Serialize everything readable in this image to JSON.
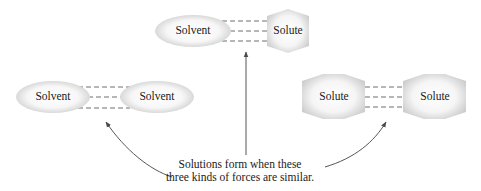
{
  "diagram": {
    "type": "intermolecular-forces-in-solutions",
    "pairs": [
      {
        "id": "solvent-solute",
        "position": "top-center",
        "left": {
          "label": "Solvent",
          "shape": "ellipse"
        },
        "right": {
          "label": "Solute",
          "shape": "hexagon"
        },
        "interaction": "dashed-lines-x3"
      },
      {
        "id": "solvent-solvent",
        "position": "middle-left",
        "left": {
          "label": "Solvent",
          "shape": "ellipse"
        },
        "right": {
          "label": "Solvent",
          "shape": "ellipse"
        },
        "interaction": "dashed-lines-x3"
      },
      {
        "id": "solute-solute",
        "position": "middle-right",
        "left": {
          "label": "Solute",
          "shape": "hexagon"
        },
        "right": {
          "label": "Solute",
          "shape": "hexagon"
        },
        "interaction": "dashed-lines-x3"
      }
    ],
    "caption": {
      "line1": "Solutions form when these",
      "line2": "three kinds of forces are similar."
    },
    "arrows": [
      {
        "from": "caption",
        "to": "solvent-solvent",
        "style": "curved"
      },
      {
        "from": "caption",
        "to": "solvent-solute",
        "style": "straight"
      },
      {
        "from": "caption",
        "to": "solute-solute",
        "style": "curved"
      }
    ],
    "colors": {
      "shape_fill_center": "#fafafa",
      "shape_fill_edge": "#d4d4d4",
      "dash_line": "#6e6e6e",
      "arrow": "#555555",
      "text": "#1a1a1a"
    }
  }
}
